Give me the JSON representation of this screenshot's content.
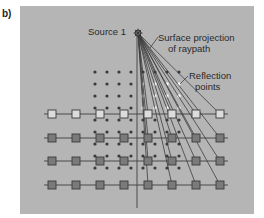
{
  "figure": {
    "panel_label": "b)",
    "background_color": "#ffffff",
    "panel_color": "#b5b5b5",
    "line_color": "#4a4a4a"
  },
  "source": {
    "label": "Source 1",
    "x": 138,
    "y": 33
  },
  "annotations": {
    "surface_projection_line1": "Surface projection",
    "surface_projection_line2": "of raypath",
    "reflection_line1": "Reflection",
    "reflection_line2": "points"
  },
  "dot_grid": {
    "columns_x": [
      95,
      107,
      119,
      131,
      143,
      155,
      167,
      179
    ],
    "rows_y": [
      72,
      84,
      96,
      108,
      120,
      132,
      144,
      156,
      168
    ],
    "highlight_columns_x": [
      143,
      155,
      167,
      179
    ],
    "highlight_rows_y": [
      84,
      96,
      108
    ],
    "dot_color": "#3a3a3a",
    "highlight_color": "#ffffff"
  },
  "receiver_lines": [
    {
      "y": 114,
      "fill": "#dcdcdc"
    },
    {
      "y": 138,
      "fill": "#7a7a7a"
    },
    {
      "y": 161,
      "fill": "#7a7a7a"
    },
    {
      "y": 185,
      "fill": "#7a7a7a"
    }
  ],
  "receiver_x": [
    52,
    76,
    100,
    124,
    148,
    172,
    196,
    220
  ],
  "ray_target_x": [
    148,
    172,
    196,
    220
  ]
}
